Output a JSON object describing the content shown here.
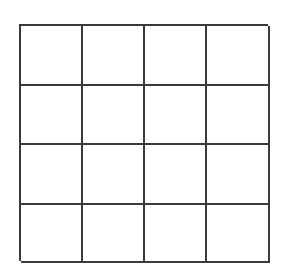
{
  "figure": {
    "name": "blank-4x4-grid",
    "title": "",
    "rows": 4,
    "columns": 4,
    "cell_count": 16,
    "line_color": "#3a3a3a",
    "line_width_px": 2,
    "cell_fill_color": "#ffffff",
    "background_color": "#ffffff",
    "cells": [
      {
        "row": 1,
        "column": 1,
        "label": ""
      },
      {
        "row": 1,
        "column": 2,
        "label": ""
      },
      {
        "row": 1,
        "column": 3,
        "label": ""
      },
      {
        "row": 1,
        "column": 4,
        "label": ""
      },
      {
        "row": 2,
        "column": 1,
        "label": ""
      },
      {
        "row": 2,
        "column": 2,
        "label": ""
      },
      {
        "row": 2,
        "column": 3,
        "label": ""
      },
      {
        "row": 2,
        "column": 4,
        "label": ""
      },
      {
        "row": 3,
        "column": 1,
        "label": ""
      },
      {
        "row": 3,
        "column": 2,
        "label": ""
      },
      {
        "row": 3,
        "column": 3,
        "label": ""
      },
      {
        "row": 3,
        "column": 4,
        "label": ""
      },
      {
        "row": 4,
        "column": 1,
        "label": ""
      },
      {
        "row": 4,
        "column": 2,
        "label": ""
      },
      {
        "row": 4,
        "column": 3,
        "label": ""
      },
      {
        "row": 4,
        "column": 4,
        "label": ""
      }
    ]
  }
}
